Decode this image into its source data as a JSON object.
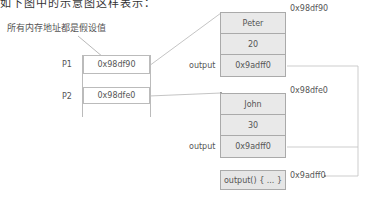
{
  "header": {
    "partial_text": "如下图中的示意图这样表示："
  },
  "annotation": {
    "text": "所有内存地址都是假设值"
  },
  "stack": {
    "variables": [
      {
        "name": "P1",
        "value": "0x98df90"
      },
      {
        "name": "P2",
        "value": "0x98dfe0"
      }
    ]
  },
  "heap_objects": [
    {
      "address": "0x98df90",
      "fields": [
        {
          "label": "",
          "value": "Peter"
        },
        {
          "label": "",
          "value": "20"
        },
        {
          "label": "output",
          "value": "0x9adff0"
        }
      ]
    },
    {
      "address": "0x98dfe0",
      "fields": [
        {
          "label": "",
          "value": "John"
        },
        {
          "label": "",
          "value": "30"
        },
        {
          "label": "output",
          "value": "0x9adff0"
        }
      ]
    }
  ],
  "function": {
    "address": "0x9adff0",
    "body": "output() { ... }"
  },
  "colors": {
    "line": "#b5b5b5",
    "box_fill": "#e9e9e9",
    "border": "#aaaaaa"
  }
}
